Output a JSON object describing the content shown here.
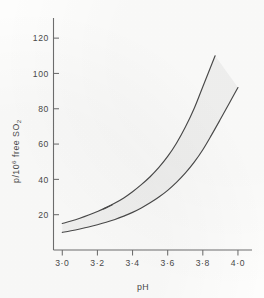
{
  "chart_data": {
    "type": "line",
    "title": "",
    "subtitle": "",
    "xlabel": "pH",
    "ylabel": "p/10⁶ free SO₂",
    "ylabel_parts": {
      "base": "p/10",
      "exponent": "6",
      "mid": " free SO",
      "subscript": "2"
    },
    "xlim": [
      2.95,
      4.08
    ],
    "ylim": [
      0,
      128
    ],
    "xticks": [
      3.0,
      3.2,
      3.4,
      3.6,
      3.8,
      4.0
    ],
    "xticklabels": [
      "3·0",
      "3·2",
      "3·4",
      "3·6",
      "3·8",
      "4·0"
    ],
    "yticks": [
      20,
      40,
      60,
      80,
      100,
      120
    ],
    "yticklabels": [
      "20",
      "40",
      "60",
      "80",
      "100",
      "120"
    ],
    "grid": false,
    "legend": false,
    "legend_position": "none",
    "band_fill_color": "#ededed",
    "line_color": "#4a4a4a",
    "axis_color": "#6e6e6e",
    "background_color": "#fdfdfc",
    "annotations": [],
    "series": [
      {
        "name": "upper bound",
        "x": [
          3.0,
          3.05,
          3.1,
          3.15,
          3.2,
          3.25,
          3.3,
          3.35,
          3.4,
          3.45,
          3.5,
          3.55,
          3.6,
          3.65,
          3.7,
          3.75,
          3.8,
          3.87
        ],
        "values": [
          15.0,
          16.4,
          18.0,
          19.8,
          21.8,
          24.0,
          26.6,
          29.5,
          33.0,
          37.0,
          41.5,
          46.8,
          53.0,
          60.5,
          69.5,
          80.0,
          92.5,
          110.0
        ]
      },
      {
        "name": "lower bound",
        "x": [
          3.0,
          3.05,
          3.1,
          3.15,
          3.2,
          3.25,
          3.3,
          3.35,
          3.4,
          3.45,
          3.5,
          3.55,
          3.6,
          3.65,
          3.7,
          3.75,
          3.8,
          3.85,
          3.9,
          3.95,
          4.0
        ],
        "values": [
          10.0,
          10.9,
          11.9,
          13.0,
          14.3,
          15.7,
          17.3,
          19.2,
          21.3,
          23.8,
          26.7,
          30.0,
          33.8,
          38.3,
          43.5,
          49.6,
          56.8,
          65.2,
          74.0,
          83.0,
          92.0
        ]
      }
    ]
  },
  "figure": {
    "caption": ""
  }
}
